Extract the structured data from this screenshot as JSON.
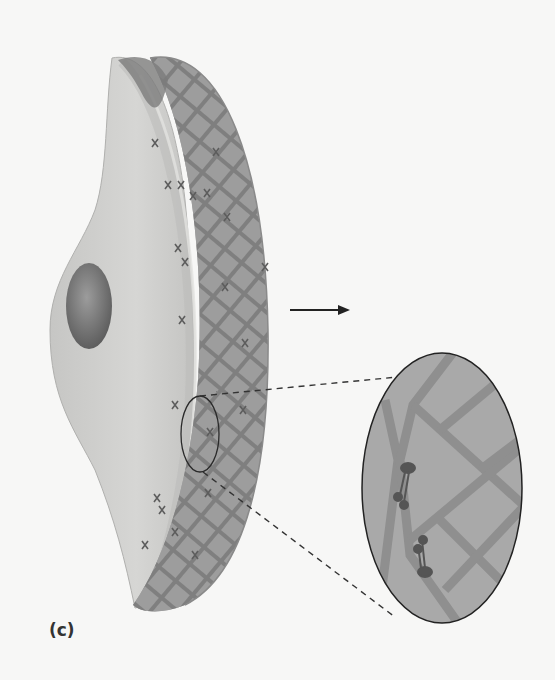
{
  "figure": {
    "panel_label": "(c)",
    "colors": {
      "background": "#f7f7f6",
      "cell_body": "#cfcfcd",
      "cell_edge": "#b5b5b3",
      "nucleus": "#7a7a7a",
      "matrix": "#9a9a9a",
      "matrix_fibers": "#7e7e7e",
      "inset_fill": "#a9a9a9",
      "adhesion_molecule": "#5a5a5a",
      "arrow": "#222222"
    },
    "elements": {
      "cell": "cell-body",
      "nucleus": "nucleus",
      "matrix": "extracellular-matrix-lattice",
      "arrow": "right-arrow",
      "magnified_region": "zoom-circle",
      "inset": "magnified-inset"
    }
  }
}
